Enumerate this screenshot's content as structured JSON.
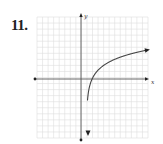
{
  "problem": {
    "number": "11."
  },
  "graph": {
    "x_axis_label": "x",
    "y_axis_label": "y",
    "grid": {
      "x_min": -10,
      "x_max": 10,
      "y_min": -10,
      "y_max": 10,
      "step": 1
    },
    "curve": {
      "description": "Logarithmic curve with vertical asymptote just right of the y-axis, crossing the x-axis near x=2, arrows at both ends",
      "x_intercept": 2
    },
    "colors": {
      "grid": "#dcdcdc",
      "axis": "#333333",
      "curve": "#444444"
    }
  }
}
